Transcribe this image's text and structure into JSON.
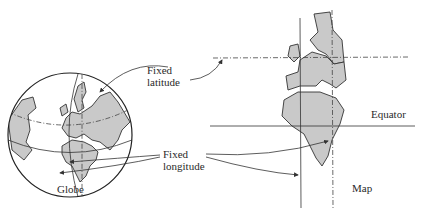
{
  "labels": {
    "fixed_latitude_line1": "Fixed",
    "fixed_latitude_line2": "latitude",
    "fixed_longitude_line1": "Fixed",
    "fixed_longitude_line2": "longitude",
    "equator": "Equator",
    "globe": "Globe",
    "map": "Map"
  },
  "colors": {
    "land_fill": "#c9c9c9",
    "line": "#333333",
    "background": "#ffffff"
  },
  "panels": [
    {
      "name": "Globe",
      "description": "Orthographic globe showing Europe and Africa with a fixed latitude and fixed longitude"
    },
    {
      "name": "Map",
      "description": "Cylindrical map projection with Europe and Africa, fixed latitude dashed line, equator and fixed longitude lines"
    }
  ]
}
